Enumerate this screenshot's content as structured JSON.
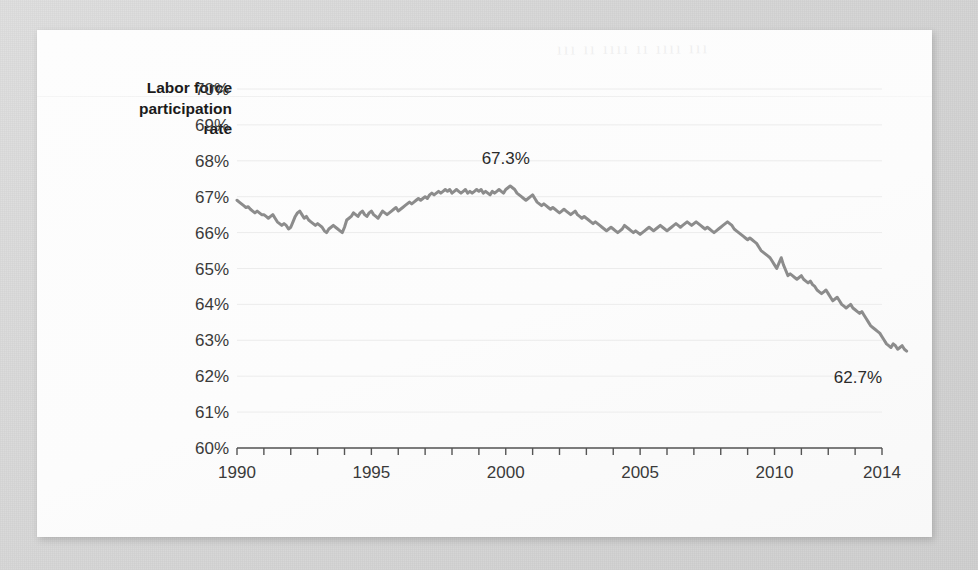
{
  "card": {
    "bleed_through_text": "ııı ıı ıııı ıı ıııı ııı"
  },
  "chart_data": {
    "type": "line",
    "title": "",
    "ylabel": "Labor force participation rate",
    "ylabel_lines": [
      "Labor force",
      "participation",
      "rate"
    ],
    "xlabel": "",
    "ylim": [
      60,
      70
    ],
    "xlim": [
      1990,
      2014
    ],
    "ytick_step": 1,
    "ytick_labels": [
      "70%",
      "69%",
      "68%",
      "67%",
      "66%",
      "65%",
      "64%",
      "63%",
      "62%",
      "61%",
      "60%"
    ],
    "ytick_values": [
      70,
      69,
      68,
      67,
      66,
      65,
      64,
      63,
      62,
      61,
      60
    ],
    "xtick_labels": [
      "1990",
      "1995",
      "2000",
      "2005",
      "2010",
      "2014"
    ],
    "xtick_values": [
      1990,
      1995,
      2000,
      2005,
      2010,
      2014
    ],
    "minor_xticks_every": 1,
    "grid": "horizontal",
    "legend": "none",
    "line_color": "#8c8c8c",
    "line_width": 3,
    "annotations": [
      {
        "label": "67.3%",
        "x": 2000.0,
        "y": 67.3,
        "position": "above"
      },
      {
        "label": "62.7%",
        "x": 2014.0,
        "y": 62.7,
        "position": "below"
      }
    ],
    "series": [
      {
        "name": "Labor force participation rate",
        "frequency": "monthly",
        "x_start": 1990.0,
        "x_step": 0.0833333,
        "values": [
          66.9,
          66.85,
          66.8,
          66.75,
          66.7,
          66.72,
          66.65,
          66.6,
          66.55,
          66.6,
          66.55,
          66.5,
          66.5,
          66.45,
          66.4,
          66.45,
          66.5,
          66.4,
          66.3,
          66.25,
          66.2,
          66.25,
          66.2,
          66.1,
          66.15,
          66.3,
          66.45,
          66.55,
          66.6,
          66.5,
          66.4,
          66.45,
          66.35,
          66.3,
          66.25,
          66.2,
          66.25,
          66.2,
          66.15,
          66.05,
          66.0,
          66.1,
          66.15,
          66.2,
          66.15,
          66.1,
          66.05,
          66.0,
          66.15,
          66.35,
          66.4,
          66.45,
          66.55,
          66.5,
          66.45,
          66.55,
          66.6,
          66.5,
          66.45,
          66.55,
          66.6,
          66.5,
          66.45,
          66.4,
          66.5,
          66.6,
          66.55,
          66.5,
          66.55,
          66.6,
          66.65,
          66.7,
          66.6,
          66.65,
          66.7,
          66.75,
          66.8,
          66.85,
          66.8,
          66.85,
          66.9,
          66.95,
          66.9,
          66.95,
          67.0,
          66.95,
          67.05,
          67.1,
          67.05,
          67.1,
          67.15,
          67.1,
          67.15,
          67.2,
          67.15,
          67.2,
          67.1,
          67.15,
          67.2,
          67.15,
          67.1,
          67.15,
          67.2,
          67.1,
          67.15,
          67.1,
          67.15,
          67.2,
          67.15,
          67.2,
          67.1,
          67.15,
          67.1,
          67.05,
          67.15,
          67.1,
          67.15,
          67.2,
          67.15,
          67.1,
          67.2,
          67.25,
          67.3,
          67.25,
          67.2,
          67.1,
          67.05,
          67.0,
          66.95,
          66.9,
          66.95,
          67.0,
          67.05,
          66.95,
          66.85,
          66.8,
          66.75,
          66.8,
          66.75,
          66.7,
          66.65,
          66.7,
          66.65,
          66.6,
          66.55,
          66.6,
          66.65,
          66.6,
          66.55,
          66.5,
          66.55,
          66.6,
          66.5,
          66.45,
          66.4,
          66.45,
          66.4,
          66.35,
          66.3,
          66.25,
          66.3,
          66.25,
          66.2,
          66.15,
          66.1,
          66.05,
          66.1,
          66.15,
          66.1,
          66.05,
          66.0,
          66.05,
          66.1,
          66.2,
          66.15,
          66.1,
          66.05,
          66.0,
          66.05,
          66.0,
          65.95,
          66.0,
          66.05,
          66.1,
          66.15,
          66.1,
          66.05,
          66.1,
          66.15,
          66.2,
          66.15,
          66.1,
          66.05,
          66.1,
          66.15,
          66.2,
          66.25,
          66.2,
          66.15,
          66.2,
          66.25,
          66.3,
          66.25,
          66.2,
          66.25,
          66.3,
          66.25,
          66.2,
          66.15,
          66.1,
          66.15,
          66.1,
          66.05,
          66.0,
          66.05,
          66.1,
          66.15,
          66.2,
          66.25,
          66.3,
          66.25,
          66.2,
          66.1,
          66.05,
          66.0,
          65.95,
          65.9,
          65.85,
          65.8,
          65.85,
          65.8,
          65.75,
          65.7,
          65.6,
          65.5,
          65.45,
          65.4,
          65.35,
          65.3,
          65.2,
          65.1,
          65.0,
          65.15,
          65.3,
          65.1,
          64.95,
          64.8,
          64.85,
          64.8,
          64.75,
          64.7,
          64.75,
          64.8,
          64.7,
          64.65,
          64.6,
          64.65,
          64.55,
          64.5,
          64.4,
          64.35,
          64.3,
          64.35,
          64.4,
          64.3,
          64.2,
          64.1,
          64.15,
          64.2,
          64.1,
          64.0,
          63.95,
          63.9,
          63.95,
          64.0,
          63.9,
          63.85,
          63.8,
          63.75,
          63.8,
          63.7,
          63.6,
          63.5,
          63.4,
          63.35,
          63.3,
          63.25,
          63.2,
          63.1,
          63.0,
          62.9,
          62.85,
          62.8,
          62.9,
          62.85,
          62.75,
          62.8,
          62.85,
          62.75,
          62.7
        ]
      }
    ]
  }
}
